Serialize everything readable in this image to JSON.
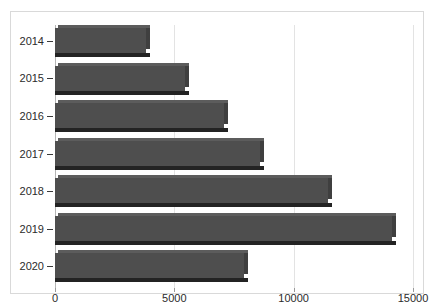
{
  "chart_data": {
    "type": "bar",
    "orientation": "horizontal",
    "style": "3d-extruded",
    "title": "",
    "subtitle": "",
    "xlabel": "",
    "ylabel": "",
    "categories": [
      "2014",
      "2015",
      "2016",
      "2017",
      "2018",
      "2019",
      "2020"
    ],
    "values": [
      3800,
      5450,
      7100,
      8600,
      11450,
      14100,
      7900
    ],
    "series": [
      {
        "name": "",
        "values": [
          3800,
          5450,
          7100,
          8600,
          11450,
          14100,
          7900
        ]
      }
    ],
    "xlim": [
      0,
      15000
    ],
    "xticks": [
      0,
      5000,
      10000,
      15000
    ],
    "xtick_labels": [
      "0",
      "5000",
      "10000",
      "15000"
    ],
    "ytick_labels": [
      "2014",
      "2015",
      "2016",
      "2017",
      "2018",
      "2019",
      "2020"
    ],
    "grid": true,
    "grid_axis": "x",
    "legend": false,
    "legend_position": "none",
    "annotations": [],
    "colors": {
      "bar_face": "#4e4e4e",
      "bar_top": "#5c5c5c",
      "bar_side": "#3f3f3f",
      "bar_shadow": "#232323",
      "gridline": "#e3e3e3",
      "axis": "#b5b5b5",
      "frame_border": "#d9d9d9",
      "background": "#ffffff",
      "tick_text": "#2b2b2b"
    }
  }
}
